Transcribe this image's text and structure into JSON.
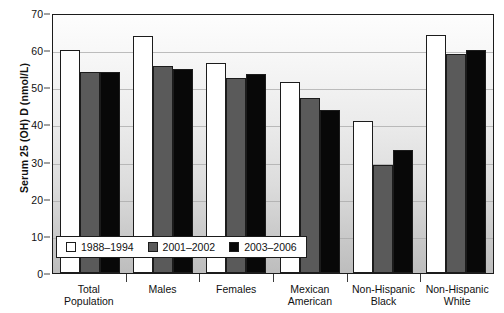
{
  "chart_data": {
    "type": "bar",
    "title": "",
    "xlabel": "",
    "ylabel": "Serum 25 (OH) D (nmol/L)",
    "ylim": [
      0,
      70
    ],
    "yticks": [
      0,
      10,
      20,
      30,
      40,
      50,
      60,
      70
    ],
    "grid": true,
    "legend_position": "inside bottom-left",
    "categories": [
      "Total\nPopulation",
      "Males",
      "Females",
      "Mexican\nAmerican",
      "Non-Hispanic\nBlack",
      "Non-Hispanic\nWhite"
    ],
    "category_lines": [
      [
        "Total",
        "Population"
      ],
      [
        "Males",
        ""
      ],
      [
        "Females",
        ""
      ],
      [
        "Mexican",
        "American"
      ],
      [
        "Non-Hispanic",
        "Black"
      ],
      [
        "Non-Hispanic",
        "White"
      ]
    ],
    "series": [
      {
        "name": "1988–1994",
        "color": "#ffffff",
        "values": [
          60.0,
          63.8,
          56.5,
          51.5,
          41.0,
          64.0
        ]
      },
      {
        "name": "2001–2002",
        "color": "#5a5a5a",
        "values": [
          54.0,
          55.8,
          52.5,
          47.0,
          29.0,
          59.0
        ]
      },
      {
        "name": "2003–2006",
        "color": "#080808",
        "values": [
          54.0,
          54.8,
          53.5,
          44.0,
          33.0,
          60.0
        ]
      }
    ]
  },
  "legend": {
    "entries": [
      {
        "label": "1988–1994",
        "swatch": "white-swatch"
      },
      {
        "label": "2001–2002",
        "swatch": "gray-swatch"
      },
      {
        "label": "2003–2006",
        "swatch": "black-swatch"
      }
    ]
  },
  "caption": {
    "text": ""
  }
}
